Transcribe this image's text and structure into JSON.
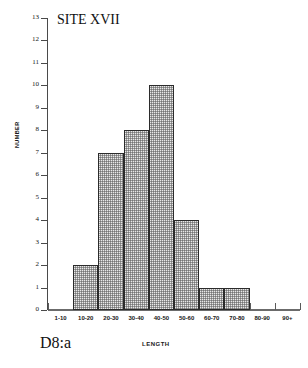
{
  "chart_data": {
    "type": "bar",
    "title": "SITE XVII",
    "caption": "D8:a",
    "xlabel": "LENGTH",
    "ylabel": "NUMBER",
    "categories": [
      "1-10",
      "10-20",
      "20-30",
      "30-40",
      "40-50",
      "50-60",
      "60-70",
      "70-80",
      "80-90",
      "90+"
    ],
    "values": [
      0,
      2,
      7,
      8,
      10,
      4,
      1,
      1,
      0,
      0
    ],
    "ylim": [
      0,
      13
    ],
    "ytick_labels": [
      "13",
      "12",
      "11",
      "10",
      "9",
      "8",
      "7",
      "6",
      "5",
      "4",
      "3",
      "2",
      "1",
      "0"
    ],
    "ytick_values": [
      13,
      12,
      11,
      10,
      9,
      8,
      7,
      6,
      5,
      4,
      3,
      2,
      1,
      0
    ],
    "grid": false,
    "legend": false,
    "bar_fill": "#e9e9e9",
    "bar_edge": "#2b2b2b",
    "axis_color": "#4a4a4a"
  }
}
